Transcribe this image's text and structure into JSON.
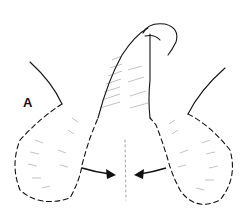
{
  "figure": {
    "panel_label": "A",
    "colors": {
      "ink": "#111111",
      "background": "#ffffff",
      "hatch": "#555555"
    },
    "elements": [
      "penile-shaft",
      "glans",
      "left-scrotal-flap",
      "right-scrotal-flap",
      "dashed-incision-left",
      "dashed-incision-right",
      "arrow-left-to-midline",
      "arrow-right-to-midline",
      "thigh-contour-left",
      "thigh-contour-right",
      "midline-raphe"
    ]
  }
}
